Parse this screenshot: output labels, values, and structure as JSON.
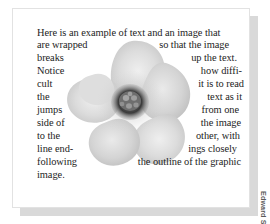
{
  "figure": {
    "type": "text-wrap-around-image-example",
    "credit": "Edward Skintik",
    "image_subject": "hibiscus-flower-grayscale",
    "colors": {
      "page": "#ffffff",
      "card_border": "#e2e2e2",
      "shadow": "#d9d9d9",
      "text": "#1d1d1d",
      "credit_text": "#5a5a5a",
      "petal_light": "#e6e6e6",
      "petal_mid": "#cfcfcf",
      "petal_shade": "#bdbdbd",
      "center_dark": "#3a3a3a"
    }
  },
  "body_text": {
    "full_paragraph": "Here is an example of text and an image that are wrapped so that the image breaks up the text. Notice how difficult it is to read the text as it jumps from one side of the image to the other, with the line endings closely following the outline of the graphic image.",
    "lines": [
      {
        "left": "Here is an example of text and an image that",
        "right": ""
      },
      {
        "left": "are wrapped",
        "right": "so that the image"
      },
      {
        "left": "breaks",
        "right": "up the text."
      },
      {
        "left": "Notice",
        "right": "how diffi-"
      },
      {
        "left": "cult",
        "right": "it is to read"
      },
      {
        "left": "the",
        "right": "text as it"
      },
      {
        "left": "jumps",
        "right": "from one"
      },
      {
        "left": "side of",
        "right": "the image"
      },
      {
        "left": "to the",
        "right": "other, with"
      },
      {
        "left": "line end-",
        "right": "ings closely"
      },
      {
        "left": "following",
        "right": "the outline of the graphic"
      },
      {
        "left": "image.",
        "right": ""
      }
    ]
  }
}
